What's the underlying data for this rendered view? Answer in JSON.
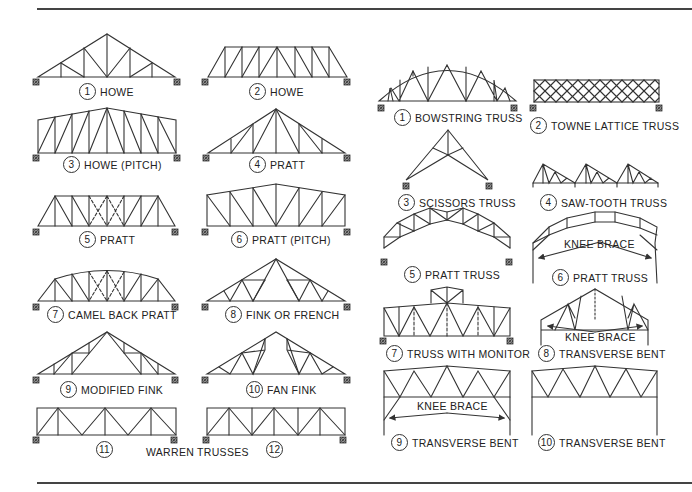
{
  "figure": {
    "left_panel": {
      "items": [
        {
          "num": "1",
          "label": "HOWE"
        },
        {
          "num": "2",
          "label": "HOWE"
        },
        {
          "num": "3",
          "label": "HOWE (PITCH)"
        },
        {
          "num": "4",
          "label": "PRATT"
        },
        {
          "num": "5",
          "label": "PRATT"
        },
        {
          "num": "6",
          "label": "PRATT (PITCH)"
        },
        {
          "num": "7",
          "label": "CAMEL BACK PRATT"
        },
        {
          "num": "8",
          "label": "FINK OR FRENCH"
        },
        {
          "num": "9",
          "label": "MODIFIED FINK"
        },
        {
          "num": "10",
          "label": "FAN FINK"
        },
        {
          "num": "11",
          "label": ""
        },
        {
          "num": "12",
          "label": ""
        }
      ],
      "group_caption": "WARREN TRUSSES"
    },
    "right_panel": {
      "items": [
        {
          "num": "1",
          "label": "BOWSTRING TRUSS"
        },
        {
          "num": "2",
          "label": "TOWNE LATTICE TRUSS"
        },
        {
          "num": "3",
          "label": "SCISSORS TRUSS"
        },
        {
          "num": "4",
          "label": "SAW-TOOTH TRUSS"
        },
        {
          "num": "5",
          "label": "PRATT TRUSS"
        },
        {
          "num": "6",
          "label": "PRATT TRUSS"
        },
        {
          "num": "7",
          "label": "TRUSS WITH MONITOR"
        },
        {
          "num": "8",
          "label": "TRANSVERSE BENT"
        },
        {
          "num": "9",
          "label": "TRANSVERSE BENT"
        },
        {
          "num": "10",
          "label": "TRANSVERSE BENT"
        }
      ],
      "annotations": [
        "KNEE BRACE",
        "KNEE BRACE",
        "KNEE BRACE"
      ]
    },
    "colors": {
      "line": "#333333",
      "rule": "#444444"
    }
  }
}
